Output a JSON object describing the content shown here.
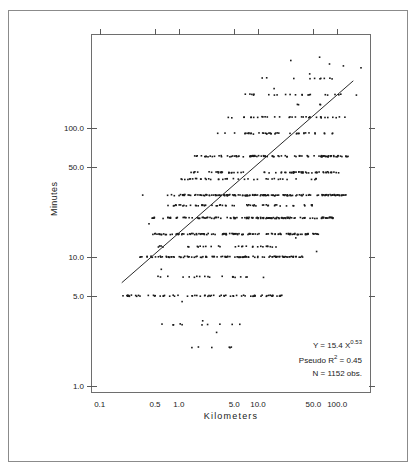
{
  "figure": {
    "clipped_header_text": "",
    "x_axis_title": "Kilometers",
    "y_axis_title": "Minutes"
  },
  "annotations": {
    "equation_prefix": "Y = 15.4 X",
    "equation_exponent": "0.53",
    "pseudo_r2_prefix": "Pseudo R",
    "pseudo_r2_sup": "2",
    "pseudo_r2_value": " = 0.45",
    "n_obs": "N = 1152 obs."
  },
  "chart_data": {
    "type": "scatter",
    "title": "",
    "xlabel": "Kilometers",
    "ylabel": "Minutes",
    "xscale": "log",
    "yscale": "log",
    "xlim": [
      0.08,
      260
    ],
    "ylim": [
      0.9,
      520
    ],
    "grid": false,
    "legend": "none",
    "xticks": [
      0.1,
      0.5,
      1.0,
      5.0,
      10.0,
      50.0,
      100.0
    ],
    "xtick_labels": [
      "0.1",
      "0.5",
      "1.0",
      "5.0",
      "10.0",
      "50.0",
      "100.0"
    ],
    "yticks": [
      1.0,
      5.0,
      10.0,
      50.0,
      100.0
    ],
    "ytick_labels": [
      "1.0",
      "5.0",
      "10.0",
      "50.0",
      "100.0"
    ],
    "n_observations": 1152,
    "fit": {
      "label": "Y = 15.4 X^0.53",
      "coefficient": 15.4,
      "exponent": 0.53,
      "pseudo_r2": 0.45,
      "line_x": [
        0.19,
        160.0
      ],
      "line_y": [
        6.3,
        230.0
      ]
    },
    "note": "Travel time versus trip distance; observations cluster on rounded reported minute values (5, 10, 15, 20, 30, 45, 60, 90, 120, 180) producing horizontal bands.",
    "bands": [
      {
        "minutes": 240,
        "x_from": 9.0,
        "x_to": 120.0,
        "count": 10
      },
      {
        "minutes": 180,
        "x_from": 6.0,
        "x_to": 200.0,
        "count": 22
      },
      {
        "minutes": 150,
        "x_from": 30.0,
        "x_to": 70.0,
        "count": 4
      },
      {
        "minutes": 120,
        "x_from": 3.2,
        "x_to": 150.0,
        "count": 34
      },
      {
        "minutes": 90,
        "x_from": 2.5,
        "x_to": 120.0,
        "count": 40
      },
      {
        "minutes": 60,
        "x_from": 1.5,
        "x_to": 150.0,
        "count": 95
      },
      {
        "minutes": 45,
        "x_from": 1.2,
        "x_to": 110.0,
        "count": 70
      },
      {
        "minutes": 40,
        "x_from": 1.0,
        "x_to": 60.0,
        "count": 40
      },
      {
        "minutes": 30,
        "x_from": 0.7,
        "x_to": 130.0,
        "count": 150
      },
      {
        "minutes": 25,
        "x_from": 0.7,
        "x_to": 50.0,
        "count": 55
      },
      {
        "minutes": 20,
        "x_from": 0.45,
        "x_to": 90.0,
        "count": 130
      },
      {
        "minutes": 15,
        "x_from": 0.38,
        "x_to": 60.0,
        "count": 120
      },
      {
        "minutes": 12,
        "x_from": 0.5,
        "x_to": 20.0,
        "count": 30
      },
      {
        "minutes": 10,
        "x_from": 0.3,
        "x_to": 40.0,
        "count": 110
      },
      {
        "minutes": 7,
        "x_from": 0.5,
        "x_to": 12.0,
        "count": 20
      },
      {
        "minutes": 5,
        "x_from": 0.18,
        "x_to": 20.0,
        "count": 70
      },
      {
        "minutes": 3,
        "x_from": 0.6,
        "x_to": 9.0,
        "count": 10
      },
      {
        "minutes": 2,
        "x_from": 0.8,
        "x_to": 5.0,
        "count": 6
      }
    ],
    "scatter_extra": [
      {
        "x": 0.35,
        "y": 30
      },
      {
        "x": 0.42,
        "y": 18
      },
      {
        "x": 0.6,
        "y": 8
      },
      {
        "x": 1.1,
        "y": 4.5
      },
      {
        "x": 2.0,
        "y": 3.2
      },
      {
        "x": 3.0,
        "y": 2.6
      },
      {
        "x": 16.0,
        "y": 200
      },
      {
        "x": 45.0,
        "y": 260
      },
      {
        "x": 80.0,
        "y": 310
      },
      {
        "x": 120.0,
        "y": 300
      },
      {
        "x": 26.0,
        "y": 330
      },
      {
        "x": 60.0,
        "y": 350
      },
      {
        "x": 200.0,
        "y": 290
      },
      {
        "x": 30.0,
        "y": 14
      },
      {
        "x": 55.0,
        "y": 11
      }
    ]
  }
}
